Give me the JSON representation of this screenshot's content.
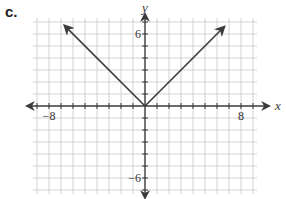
{
  "panel_label": "c.",
  "chart_data": {
    "type": "line",
    "title": "",
    "function": "y = |x|",
    "xlabel": "x",
    "ylabel": "y",
    "xlim": [
      -9,
      9
    ],
    "ylim": [
      -7,
      7
    ],
    "grid": true,
    "grid_step": 1,
    "x_tick_labels": [
      {
        "value": -8,
        "label": "−8"
      },
      {
        "value": 8,
        "label": "8"
      }
    ],
    "y_tick_labels": [
      {
        "value": 6,
        "label": "6"
      },
      {
        "value": -6,
        "label": "−6"
      }
    ],
    "series": [
      {
        "name": "y = |x|",
        "x": [
          -6.7,
          0,
          6.6
        ],
        "y": [
          6.7,
          0,
          6.6
        ],
        "arrows_at_ends": true
      }
    ],
    "legend": null
  },
  "colors": {
    "grid": "#c8c8c8",
    "axis": "#3a3a3a",
    "line": "#3a3a3a"
  }
}
